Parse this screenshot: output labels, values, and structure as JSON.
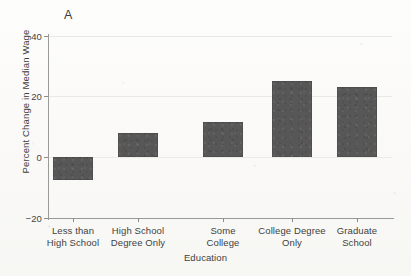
{
  "chart_data": {
    "type": "bar",
    "title": "",
    "panel_label": "A",
    "xlabel": "Education",
    "ylabel": "Percent Change in Median Wage",
    "categories": [
      "Less than\nHigh School",
      "High School\nDegree Only",
      "Some\nCollege",
      "College Degree\nOnly",
      "Graduate\nSchool"
    ],
    "category_lines": [
      [
        "Less than",
        "High School"
      ],
      [
        "High School",
        "Degree Only"
      ],
      [
        "Some",
        "College"
      ],
      [
        "College Degree",
        "Only"
      ],
      [
        "Graduate",
        "School"
      ]
    ],
    "values": [
      -7.5,
      8.0,
      11.5,
      25.0,
      23.0
    ],
    "ylim": [
      -20,
      40
    ],
    "yticks": [
      40,
      20,
      0,
      -20
    ],
    "ytick_labels": [
      "40",
      "20",
      "0",
      "−20"
    ],
    "grid": true,
    "grid_axis": "y",
    "legend": null,
    "bar_color": "#575757",
    "background_color": "#fbfbf9",
    "axis_color": "#9a9a96",
    "text_color": "#3f3f3f"
  }
}
